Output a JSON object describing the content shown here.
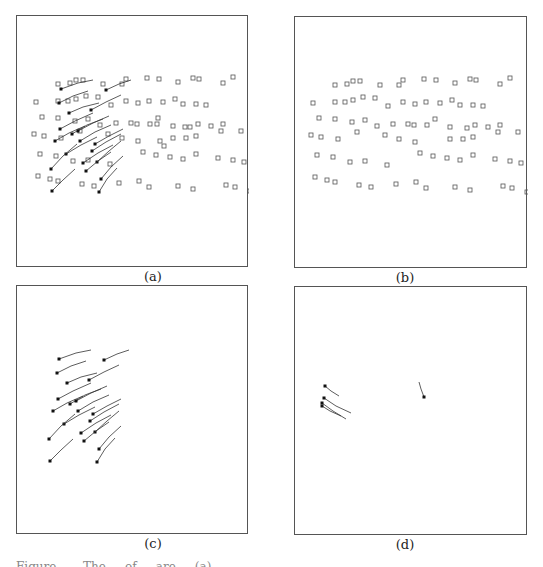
{
  "figure": {
    "panels": [
      {
        "id": "a",
        "label": "(a)",
        "content": "squares + trajectories"
      },
      {
        "id": "b",
        "label": "(b)",
        "content": "squares only"
      },
      {
        "id": "c",
        "label": "(c)",
        "content": "trajectories only"
      },
      {
        "id": "d",
        "label": "(d)",
        "content": "few short trajectories"
      }
    ],
    "caption": "Figure ... . The ... of ... are ... (a) ..."
  },
  "squares": [
    [
      28,
      34
    ],
    [
      58,
      35
    ],
    [
      56,
      33
    ],
    [
      84,
      31
    ],
    [
      103,
      36
    ],
    [
      110,
      35
    ],
    [
      128,
      36
    ],
    [
      158,
      37
    ],
    [
      166,
      33
    ],
    [
      188,
      35
    ],
    [
      213,
      39
    ],
    [
      240,
      38
    ],
    [
      33,
      50
    ],
    [
      44,
      49
    ],
    [
      56,
      48
    ],
    [
      75,
      52
    ],
    [
      87,
      46
    ],
    [
      101,
      50
    ],
    [
      113,
      50
    ],
    [
      137,
      44
    ],
    [
      161,
      49
    ],
    [
      182,
      47
    ],
    [
      204,
      49
    ],
    [
      229,
      41
    ],
    [
      28,
      64
    ],
    [
      38,
      64
    ],
    [
      51,
      57
    ],
    [
      65,
      61
    ],
    [
      93,
      58
    ],
    [
      113,
      62
    ],
    [
      126,
      64
    ],
    [
      150,
      58
    ],
    [
      158,
      64
    ],
    [
      180,
      66
    ],
    [
      195,
      65
    ],
    [
      208,
      63
    ],
    [
      20,
      77
    ],
    [
      40,
      75
    ],
    [
      96,
      71
    ],
    [
      108,
      69
    ],
    [
      146,
      73
    ],
    [
      207,
      84
    ],
    [
      210,
      92
    ],
    [
      213,
      92
    ],
    [
      140,
      78
    ],
    [
      143,
      95
    ],
    [
      147,
      100
    ],
    [
      168,
      81
    ]
  ],
  "squaresB": [
    [
      40,
      118
    ],
    [
      52,
      117
    ],
    [
      58,
      114
    ],
    [
      65,
      114
    ],
    [
      85,
      118
    ],
    [
      104,
      118
    ],
    [
      108,
      113
    ],
    [
      129,
      112
    ],
    [
      141,
      113
    ],
    [
      160,
      116
    ],
    [
      175,
      112
    ],
    [
      181,
      113
    ],
    [
      205,
      117
    ],
    [
      215,
      111
    ],
    [
      239,
      112
    ],
    [
      18,
      136
    ],
    [
      40,
      135
    ],
    [
      50,
      135
    ],
    [
      58,
      133
    ],
    [
      68,
      130
    ],
    [
      80,
      131
    ],
    [
      93,
      139
    ],
    [
      108,
      135
    ],
    [
      120,
      137
    ],
    [
      131,
      135
    ],
    [
      145,
      136
    ],
    [
      157,
      133
    ],
    [
      165,
      138
    ],
    [
      178,
      138
    ],
    [
      188,
      139
    ],
    [
      24,
      151
    ],
    [
      40,
      152
    ],
    [
      57,
      155
    ],
    [
      70,
      153
    ],
    [
      82,
      159
    ],
    [
      98,
      157
    ],
    [
      113,
      157
    ],
    [
      119,
      158
    ],
    [
      132,
      158
    ],
    [
      140,
      152
    ],
    [
      155,
      160
    ],
    [
      172,
      161
    ],
    [
      180,
      158
    ],
    [
      193,
      160
    ],
    [
      205,
      158
    ],
    [
      16,
      168
    ],
    [
      26,
      170
    ],
    [
      43,
      172
    ],
    [
      62,
      165
    ],
    [
      90,
      168
    ],
    [
      104,
      172
    ],
    [
      120,
      175
    ],
    [
      155,
      172
    ],
    [
      168,
      172
    ],
    [
      178,
      170
    ],
    [
      203,
      165
    ],
    [
      223,
      165
    ],
    [
      22,
      188
    ],
    [
      38,
      190
    ],
    [
      55,
      195
    ],
    [
      70,
      194
    ],
    [
      92,
      198
    ],
    [
      125,
      186
    ],
    [
      138,
      189
    ],
    [
      152,
      191
    ],
    [
      165,
      193
    ],
    [
      178,
      188
    ],
    [
      200,
      192
    ],
    [
      215,
      194
    ],
    [
      226,
      196
    ],
    [
      20,
      210
    ],
    [
      32,
      213
    ],
    [
      40,
      215
    ],
    [
      64,
      218
    ],
    [
      76,
      220
    ],
    [
      101,
      217
    ],
    [
      121,
      215
    ],
    [
      131,
      221
    ],
    [
      160,
      220
    ],
    [
      175,
      223
    ],
    [
      208,
      219
    ],
    [
      217,
      221
    ],
    [
      232,
      225
    ]
  ],
  "pathsC": [
    [
      [
        58,
        358
      ],
      [
        75,
        352
      ],
      [
        90,
        349
      ]
    ],
    [
      [
        56,
        372
      ],
      [
        70,
        365
      ],
      [
        85,
        360
      ]
    ],
    [
      [
        66,
        382
      ],
      [
        80,
        376
      ],
      [
        96,
        372
      ]
    ],
    [
      [
        57,
        398
      ],
      [
        72,
        390
      ],
      [
        90,
        382
      ]
    ],
    [
      [
        69,
        403
      ],
      [
        84,
        394
      ],
      [
        100,
        388
      ]
    ],
    [
      [
        52,
        410
      ],
      [
        66,
        402
      ],
      [
        82,
        395
      ]
    ],
    [
      [
        77,
        410
      ],
      [
        92,
        401
      ],
      [
        108,
        394
      ]
    ],
    [
      [
        92,
        413
      ],
      [
        106,
        405
      ],
      [
        120,
        398
      ]
    ],
    [
      [
        63,
        423
      ],
      [
        78,
        414
      ],
      [
        94,
        406
      ]
    ],
    [
      [
        48,
        438
      ],
      [
        60,
        425
      ],
      [
        74,
        413
      ]
    ],
    [
      [
        94,
        431
      ],
      [
        106,
        420
      ],
      [
        118,
        410
      ]
    ],
    [
      [
        83,
        440
      ],
      [
        95,
        430
      ],
      [
        108,
        421
      ]
    ],
    [
      [
        98,
        448
      ],
      [
        108,
        436
      ],
      [
        120,
        425
      ]
    ],
    [
      [
        49,
        460
      ],
      [
        60,
        449
      ],
      [
        72,
        438
      ]
    ],
    [
      [
        96,
        461
      ],
      [
        104,
        448
      ],
      [
        114,
        437
      ]
    ],
    [
      [
        88,
        379
      ],
      [
        103,
        371
      ],
      [
        118,
        364
      ]
    ],
    [
      [
        103,
        359
      ],
      [
        116,
        353
      ],
      [
        128,
        349
      ]
    ],
    [
      [
        75,
        400
      ],
      [
        90,
        392
      ],
      [
        106,
        385
      ]
    ],
    [
      [
        89,
        420
      ],
      [
        103,
        411
      ],
      [
        118,
        403
      ]
    ],
    [
      [
        80,
        432
      ],
      [
        95,
        422
      ],
      [
        110,
        414
      ]
    ]
  ],
  "pathsD": [
    [
      [
        324,
        385
      ],
      [
        330,
        390
      ],
      [
        338,
        395
      ]
    ],
    [
      [
        323,
        397
      ],
      [
        335,
        405
      ],
      [
        350,
        412
      ]
    ],
    [
      [
        321,
        402
      ],
      [
        332,
        410
      ],
      [
        345,
        418
      ]
    ],
    [
      [
        321,
        405
      ],
      [
        329,
        410
      ],
      [
        340,
        415
      ]
    ],
    [
      [
        423,
        396
      ],
      [
        420,
        388
      ],
      [
        418,
        381
      ]
    ]
  ]
}
